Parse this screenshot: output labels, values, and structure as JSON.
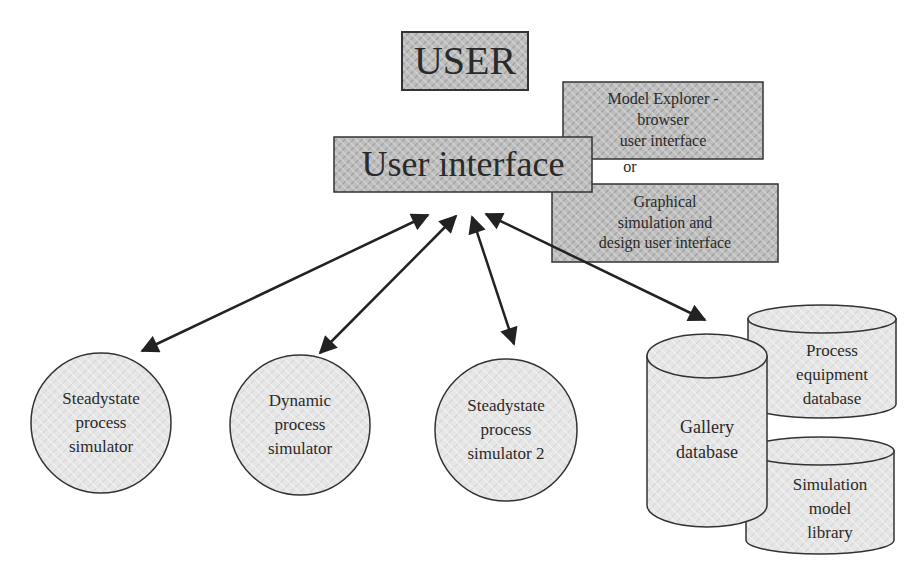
{
  "diagram": {
    "user_box": {
      "label": "USER"
    },
    "ui_box": {
      "label": "User interface"
    },
    "ui_options": {
      "option1": "Model Explorer -\nbrowser\nuser interface",
      "separator": "or",
      "option2": "Graphical\nsimulation and\ndesign user interface"
    },
    "simulators": [
      {
        "label": "Steadystate\nprocess\nsimulator"
      },
      {
        "label": "Dynamic\nprocess\nsimulator"
      },
      {
        "label": "Steadystate\nprocess\nsimulator 2"
      }
    ],
    "databases": [
      {
        "label": "Gallery\ndatabase"
      },
      {
        "label": "Process\nequipment\ndatabase"
      },
      {
        "label": "Simulation\nmodel\nlibrary"
      }
    ],
    "connections": [
      {
        "from": "User interface",
        "to": "Steadystate process simulator",
        "type": "bidirectional"
      },
      {
        "from": "User interface",
        "to": "Dynamic process simulator",
        "type": "bidirectional"
      },
      {
        "from": "User interface",
        "to": "Steadystate process simulator 2",
        "type": "bidirectional"
      },
      {
        "from": "User interface",
        "to": "Gallery database",
        "type": "bidirectional"
      }
    ],
    "colors": {
      "line": "#222222",
      "box_fill": "#c8c8c8",
      "node_fill": "#e2e2e2",
      "text": "#2a2a2a"
    }
  }
}
